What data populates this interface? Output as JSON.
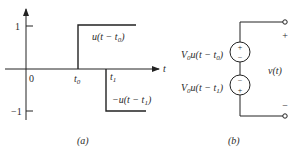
{
  "panel_a": {
    "caption": "(a)",
    "axis": {
      "x_label": "t",
      "y_ticks": [
        {
          "label": "1",
          "value": 1
        },
        {
          "label": "−1",
          "value": -1
        }
      ],
      "origin_label": "0",
      "x_marks": [
        {
          "label": "t",
          "sub": "0"
        },
        {
          "label": "t",
          "sub": "1"
        }
      ]
    },
    "curves": [
      {
        "label_pre": "u(t − t",
        "sub": "0",
        "label_post": ")",
        "level": 1,
        "starts_at": "t0"
      },
      {
        "label_pre": "−u(t − t",
        "sub": "1",
        "label_post": ")",
        "level": -1,
        "starts_at": "t1"
      }
    ]
  },
  "panel_b": {
    "caption": "(b)",
    "sources": [
      {
        "prefix": "V",
        "prefix_sub": "0",
        "expr_pre": "u(t − t",
        "expr_sub": "0",
        "expr_post": ")",
        "top_sign": "+",
        "bottom_sign": "−"
      },
      {
        "prefix": "V",
        "prefix_sub": "0",
        "expr_pre": "u(t − t",
        "expr_sub": "1",
        "expr_post": ")",
        "top_sign": "−",
        "bottom_sign": "+"
      }
    ],
    "output": {
      "label": "v(t)",
      "plus": "+",
      "minus": "−"
    }
  }
}
